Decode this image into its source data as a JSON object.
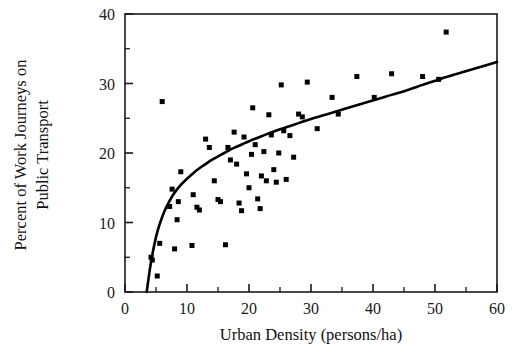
{
  "chart_data": {
    "type": "scatter",
    "title": "",
    "subtitle": "",
    "xlabel": "Urban Density (persons/ha)",
    "ylabel": "Percent of Work Journeys on Public Transport",
    "ylabel_lines": [
      "Percent of Work Journeys on",
      "Public Transport"
    ],
    "xlim": [
      0,
      60
    ],
    "ylim": [
      0,
      40
    ],
    "xticks": [
      0,
      10,
      20,
      30,
      40,
      50,
      60
    ],
    "yticks": [
      0,
      10,
      20,
      30,
      40
    ],
    "xtick_labels": [
      "0",
      "10",
      "20",
      "30",
      "40",
      "50",
      "60"
    ],
    "ytick_labels": [
      "0",
      "10",
      "20",
      "30",
      "40"
    ],
    "x_minor_ticks": [
      5,
      15,
      25,
      35,
      45,
      55
    ],
    "y_minor_ticks": [
      5,
      15,
      25,
      35
    ],
    "grid": false,
    "legend": false,
    "legend_position": "none",
    "frame": "box",
    "marker": "square",
    "marker_size_px": 5,
    "marker_color": "#000000",
    "curve_color": "#000000",
    "series": [
      {
        "name": "Cities",
        "type": "scatter",
        "points": [
          [
            4.2,
            5.0
          ],
          [
            4.4,
            4.6
          ],
          [
            5.2,
            2.3
          ],
          [
            5.6,
            7.0
          ],
          [
            6.0,
            27.4
          ],
          [
            7.2,
            12.3
          ],
          [
            7.6,
            14.8
          ],
          [
            8.0,
            6.2
          ],
          [
            8.4,
            10.4
          ],
          [
            8.6,
            13.0
          ],
          [
            9.0,
            17.3
          ],
          [
            10.8,
            6.7
          ],
          [
            11.0,
            14.0
          ],
          [
            11.6,
            12.2
          ],
          [
            12.0,
            11.8
          ],
          [
            13.0,
            22.0
          ],
          [
            13.6,
            20.8
          ],
          [
            14.4,
            16.0
          ],
          [
            15.0,
            13.3
          ],
          [
            15.4,
            13.0
          ],
          [
            16.2,
            6.8
          ],
          [
            16.6,
            20.8
          ],
          [
            17.0,
            19.0
          ],
          [
            17.6,
            23.0
          ],
          [
            18.0,
            18.4
          ],
          [
            18.4,
            12.8
          ],
          [
            18.8,
            11.7
          ],
          [
            19.2,
            22.3
          ],
          [
            19.6,
            17.0
          ],
          [
            20.0,
            15.0
          ],
          [
            20.4,
            19.8
          ],
          [
            20.6,
            26.5
          ],
          [
            21.0,
            21.2
          ],
          [
            21.4,
            13.4
          ],
          [
            21.8,
            12.0
          ],
          [
            22.0,
            16.7
          ],
          [
            22.4,
            20.2
          ],
          [
            22.8,
            16.0
          ],
          [
            23.2,
            25.5
          ],
          [
            23.6,
            22.6
          ],
          [
            24.0,
            17.6
          ],
          [
            24.4,
            15.8
          ],
          [
            24.8,
            20.0
          ],
          [
            25.2,
            29.8
          ],
          [
            25.6,
            23.2
          ],
          [
            26.0,
            16.2
          ],
          [
            26.6,
            22.5
          ],
          [
            27.2,
            19.4
          ],
          [
            28.0,
            25.6
          ],
          [
            28.6,
            25.2
          ],
          [
            29.4,
            30.2
          ],
          [
            31.0,
            23.5
          ],
          [
            33.4,
            28.0
          ],
          [
            34.4,
            25.6
          ],
          [
            37.4,
            31.0
          ],
          [
            40.2,
            28.0
          ],
          [
            43.0,
            31.4
          ],
          [
            48.0,
            31.0
          ],
          [
            51.8,
            37.4
          ],
          [
            50.6,
            30.6
          ]
        ]
      }
    ],
    "fit_curve": {
      "name": "Fitted logarithmic trend",
      "description": "Rising concave curve through the scatter",
      "points": [
        [
          3.5,
          0.0
        ],
        [
          4.0,
          3.2
        ],
        [
          4.5,
          5.8
        ],
        [
          5.0,
          7.9
        ],
        [
          5.5,
          9.5
        ],
        [
          6.0,
          10.8
        ],
        [
          6.5,
          11.9
        ],
        [
          7.0,
          12.8
        ],
        [
          7.5,
          13.6
        ],
        [
          8.0,
          14.3
        ],
        [
          9.0,
          15.4
        ],
        [
          10.0,
          16.3
        ],
        [
          11.0,
          17.1
        ],
        [
          12.0,
          17.8
        ],
        [
          13.0,
          18.4
        ],
        [
          14.0,
          19.0
        ],
        [
          15.0,
          19.5
        ],
        [
          16.0,
          20.0
        ],
        [
          17.0,
          20.5
        ],
        [
          18.0,
          20.9
        ],
        [
          19.0,
          21.3
        ],
        [
          20.0,
          21.7
        ],
        [
          22.0,
          22.4
        ],
        [
          24.0,
          23.1
        ],
        [
          26.0,
          23.7
        ],
        [
          28.0,
          24.3
        ],
        [
          30.0,
          24.9
        ],
        [
          33.0,
          25.7
        ],
        [
          36.0,
          26.5
        ],
        [
          39.0,
          27.3
        ],
        [
          42.0,
          28.1
        ],
        [
          45.0,
          28.9
        ],
        [
          48.0,
          29.8
        ],
        [
          51.0,
          30.7
        ],
        [
          54.0,
          31.5
        ],
        [
          57.0,
          32.3
        ],
        [
          60.0,
          33.1
        ]
      ]
    }
  }
}
